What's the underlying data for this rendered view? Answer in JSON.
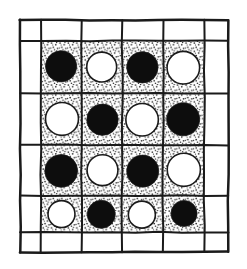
{
  "figure": {
    "description": "Hand-drawn 6 by 6 square grid. The outer ring of cells is blank white. The inner 4 by 4 cells have a stippled dotted fill and each contains one circular disc, alternating black and white in a checkerboard pattern.",
    "width": 247,
    "height": 269,
    "background_color": "#ffffff",
    "ink_color": "#1a1a1a"
  },
  "grid": {
    "columns": 6,
    "rows": 6,
    "outer_left": 20,
    "outer_top": 20,
    "outer_right": 228,
    "outer_bottom": 252,
    "column_edges": [
      20,
      41,
      82,
      122,
      163,
      204,
      228
    ],
    "row_edges": [
      20,
      41,
      93,
      145,
      196,
      232,
      252
    ],
    "line_color": "#1a1a1a",
    "line_width": 2.0,
    "border_cell_fill": "#ffffff",
    "inner_cell_fill": "stipple"
  },
  "stipple": {
    "name": "stipple-texture",
    "dot_color": "#2b2b2b",
    "base_color": "#ffffff",
    "dot_radius": 0.85,
    "spacing": 4.2,
    "jitter": 1.5
  },
  "discs": {
    "black_fill": "#0d0d0d",
    "white_fill": "#ffffff",
    "outline_color": "#1a1a1a",
    "outline_width": 1.6,
    "radius": 20,
    "pattern_name": "checkerboard",
    "rows": [
      {
        "index": 1,
        "cells": [
          {
            "column": 1,
            "color": "black"
          },
          {
            "column": 2,
            "color": "white"
          },
          {
            "column": 3,
            "color": "black"
          },
          {
            "column": 4,
            "color": "white"
          }
        ]
      },
      {
        "index": 2,
        "cells": [
          {
            "column": 1,
            "color": "white"
          },
          {
            "column": 2,
            "color": "black"
          },
          {
            "column": 3,
            "color": "white"
          },
          {
            "column": 4,
            "color": "black"
          }
        ]
      },
      {
        "index": 3,
        "cells": [
          {
            "column": 1,
            "color": "black"
          },
          {
            "column": 2,
            "color": "white"
          },
          {
            "column": 3,
            "color": "black"
          },
          {
            "column": 4,
            "color": "white"
          }
        ]
      },
      {
        "index": 4,
        "cells": [
          {
            "column": 1,
            "color": "white"
          },
          {
            "column": 2,
            "color": "black"
          },
          {
            "column": 3,
            "color": "white"
          },
          {
            "column": 4,
            "color": "black"
          }
        ]
      }
    ]
  }
}
